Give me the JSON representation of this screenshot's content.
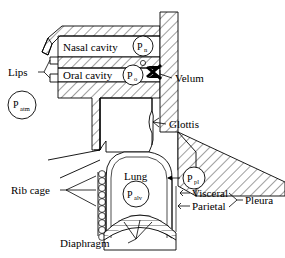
{
  "figure": {
    "background_color": "#ffffff",
    "line_color": "#000000"
  },
  "labels": {
    "nasal_cavity": "Nasal cavity",
    "oral_cavity": "Oral cavity",
    "lips": "Lips",
    "velum": "Velum",
    "glottis": "Glottis",
    "rib_cage": "Rib cage",
    "lung": "Lung",
    "visceral": "Visceral",
    "parietal": "Parietal",
    "pleura": "Pleura",
    "diaphragm": "Diaphragm"
  },
  "pressures": {
    "atmospheric": {
      "symbol": "P",
      "subscript": "atm"
    },
    "nasal": {
      "symbol": "P",
      "subscript": "n"
    },
    "oral": {
      "symbol": "P",
      "subscript": "o"
    },
    "alveolar": {
      "symbol": "P",
      "subscript": "alv"
    },
    "pleural": {
      "symbol": "P",
      "subscript": "pl"
    }
  },
  "icons": {
    "velum_closure": "velum-x-icon",
    "pleural_arrow": "pleural-pressure-arrow-icon"
  }
}
